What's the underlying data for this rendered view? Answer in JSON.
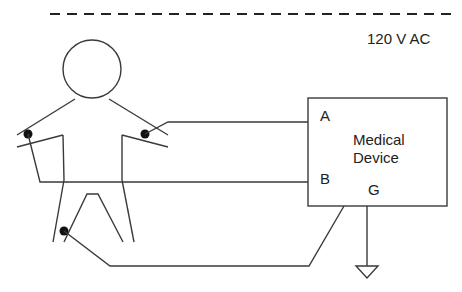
{
  "diagram": {
    "supply_label": "120 V AC",
    "device": {
      "name_line1": "Medical",
      "name_line2": "Device",
      "terminals": {
        "a": "A",
        "b": "B",
        "g": "G"
      }
    },
    "elements": [
      "dashed power line",
      "patient stick figure",
      "electrode on right arm -> terminal A",
      "electrode on left arm -> terminal B",
      "electrode on leg -> device chassis",
      "ground symbol from terminal G"
    ],
    "colors": {
      "line": "#3a3a3a",
      "electrode": "#111111",
      "background": "#ffffff"
    }
  }
}
